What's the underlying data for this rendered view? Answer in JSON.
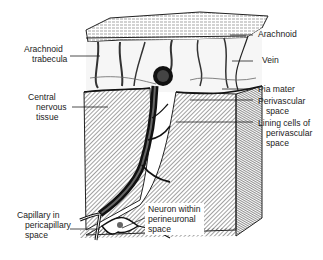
{
  "figure": {
    "colors": {
      "ink": "#1a1a1a",
      "background": "#ffffff",
      "hatch": "#333333"
    }
  },
  "labels": {
    "arachnoid_trabecula": {
      "lines": [
        "Arachnoid",
        "trabecula"
      ]
    },
    "central_nervous_tissue": {
      "lines": [
        "Central",
        "nervous",
        "tissue"
      ]
    },
    "capillary": {
      "lines": [
        "Capillary in",
        "pericapillary",
        "space"
      ]
    },
    "neuron": {
      "lines": [
        "Neuron within",
        "perineuronal",
        "space"
      ]
    },
    "arachnoid": {
      "lines": [
        "Arachnoid"
      ]
    },
    "vein": {
      "lines": [
        "Vein"
      ]
    },
    "pia_mater": {
      "lines": [
        "Pia mater"
      ]
    },
    "perivascular_space": {
      "lines": [
        "Perivascular",
        "space"
      ]
    },
    "lining_cells": {
      "lines": [
        "Lining cells of",
        "perivascular",
        "space"
      ]
    }
  }
}
